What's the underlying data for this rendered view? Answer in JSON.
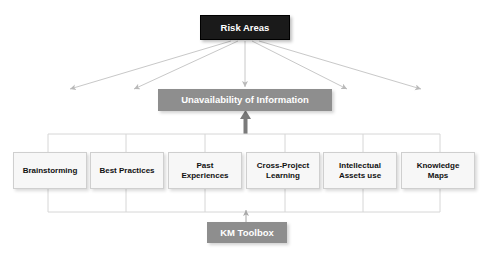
{
  "diagram": {
    "title_node": {
      "label": "Risk Areas",
      "fill": "#1a1a1a",
      "text_color": "#ffffff"
    },
    "risk_node": {
      "label": "Unavailability of Information",
      "fill": "#8e8e8e",
      "text_color": "#ffffff"
    },
    "source_node": {
      "label": "KM Toolbox",
      "fill": "#8e8e8e",
      "text_color": "#ffffff"
    },
    "tools": [
      {
        "label": "Brainstorming"
      },
      {
        "label": "Best Practices"
      },
      {
        "label": "Past\nExperiences"
      },
      {
        "label": "Cross-Project\nLearning"
      },
      {
        "label": "Intellectual\nAssets use"
      },
      {
        "label": "Knowledge\nMaps"
      }
    ],
    "connectors": {
      "fan_out_count": 5,
      "line_color": "#c8c8c8",
      "emphasis_arrow_color": "#7a7a7a",
      "bracket_color": "#d6d6d6"
    }
  }
}
